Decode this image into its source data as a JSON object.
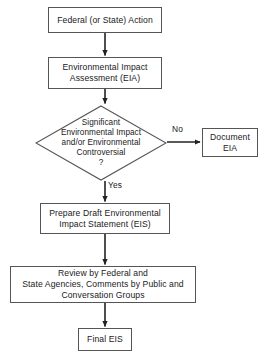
{
  "diagram": {
    "type": "flowchart",
    "colors": {
      "background": "#ffffff",
      "stroke": "#555555",
      "arrow": "#222222",
      "text": "#1a1a1a"
    },
    "nodes": {
      "federal_action": {
        "label": "Federal (or State) Action",
        "shape": "rectangle"
      },
      "eia": {
        "label": "Environmental Impact\nAssessment (EIA)",
        "shape": "rectangle"
      },
      "decision": {
        "label": "Significant\nEnvironmental Impact\nand/or Environmental\nControversial\n?",
        "shape": "diamond"
      },
      "document_eia": {
        "label": "Document\nEIA",
        "shape": "rectangle"
      },
      "draft_eis": {
        "label": "Prepare Draft Environmental\nImpact Statement (EIS)",
        "shape": "rectangle"
      },
      "review": {
        "label": "Review by Federal and\nState Agencies, Comments by Public and\nConversation Groups",
        "shape": "rectangle"
      },
      "final_eis": {
        "label": "Final EIS",
        "shape": "rectangle"
      }
    },
    "edges": {
      "no_label": "No",
      "yes_label": "Yes"
    }
  }
}
